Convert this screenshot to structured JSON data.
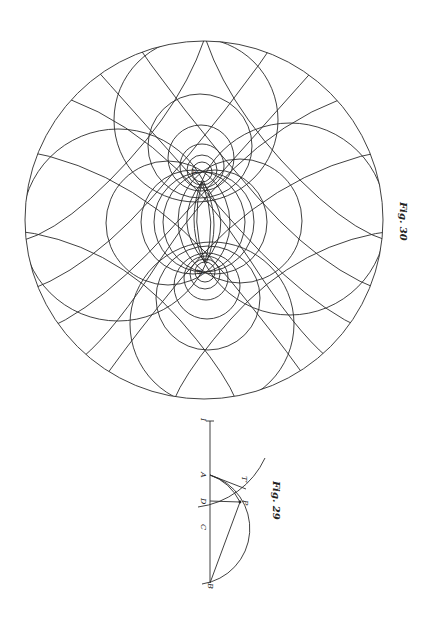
{
  "figures": [
    {
      "id": "fig30",
      "caption": "Fig. 30",
      "description": "Two families of circles around two poles A and B inside a large bounding circle, forming a curvilinear net",
      "poles": [
        {
          "label": "A",
          "x": 202,
          "y": 172
        },
        {
          "label": "B",
          "x": 205,
          "y": 272
        }
      ],
      "outer_circle": {
        "cx": 204,
        "cy": 220,
        "r": 179
      },
      "colors": {
        "stroke": "#2b2b2b",
        "background": "#ffffff"
      }
    },
    {
      "id": "fig29",
      "caption": "Fig. 29",
      "description": "Construction on a vertical line I–B with points A, D, C and point P with tangent T′",
      "points": [
        {
          "label": "I",
          "x": 210,
          "y": 420
        },
        {
          "label": "A",
          "x": 210,
          "y": 475
        },
        {
          "label": "D",
          "x": 210,
          "y": 501
        },
        {
          "label": "C",
          "x": 210,
          "y": 527
        },
        {
          "label": "B",
          "x": 210,
          "y": 583
        },
        {
          "label": "P",
          "x": 240,
          "y": 502
        },
        {
          "label": "T′",
          "x": 246,
          "y": 485
        }
      ]
    }
  ],
  "labels": {
    "fig30_caption": "Fig. 30",
    "fig29_caption": "Fig. 29",
    "fig30_A": "A",
    "fig30_B": "B",
    "fig29_I": "I",
    "fig29_A": "A",
    "fig29_D": "D",
    "fig29_C": "C",
    "fig29_B": "B",
    "fig29_P": "P",
    "fig29_T": "T′"
  }
}
